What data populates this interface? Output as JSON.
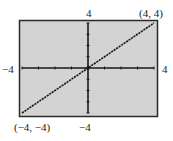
{
  "chart_data": {
    "type": "line",
    "title": "",
    "xlabel": "",
    "ylabel": "",
    "xlim": [
      -4,
      4
    ],
    "ylim": [
      -4,
      4
    ],
    "x_tick_step": 1,
    "y_tick_step": 1,
    "grid": false,
    "series": [
      {
        "name": "y = x",
        "x": [
          -4,
          4
        ],
        "y": [
          -4,
          4
        ]
      }
    ],
    "annotations": [
      {
        "text": "(4, 4)",
        "x": 4,
        "y": 4
      },
      {
        "text": "(−4, −4)",
        "x": -4,
        "y": -4
      }
    ],
    "axis_labels": {
      "x_min": "−4",
      "x_max": "4",
      "y_min": "−4",
      "y_max": "4"
    }
  },
  "colors": {
    "screen_bg": "#d3d3d3",
    "border": "#2a2a2a",
    "axis": "#1a1a1a",
    "line": "#1a1a1a"
  }
}
